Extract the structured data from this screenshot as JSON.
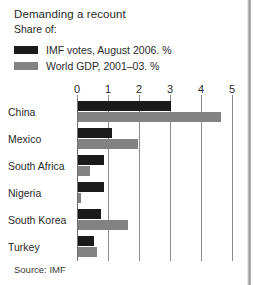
{
  "chart_data": {
    "type": "bar",
    "orientation": "horizontal",
    "title": "Demanding a recount",
    "subtitle": "Share of:",
    "source": "Source: IMF",
    "xlabel": "",
    "ylabel": "",
    "xlim": [
      0,
      5
    ],
    "xticks": [
      0,
      1,
      2,
      3,
      4,
      5
    ],
    "xtick_labels": [
      "0",
      "1",
      "2",
      "3",
      "4",
      "5"
    ],
    "grid": true,
    "legend_position": "top-left",
    "categories": [
      "China",
      "Mexico",
      "South Africa",
      "Nigeria",
      "South Korea",
      "Turkey"
    ],
    "series": [
      {
        "name": "IMF votes, August 2006. %",
        "color": "#1a1a1a",
        "values": [
          3.0,
          1.1,
          0.85,
          0.85,
          0.75,
          0.5
        ]
      },
      {
        "name": "World GDP, 2001–03. %",
        "color": "#828282",
        "values": [
          4.6,
          1.95,
          0.4,
          0.1,
          1.6,
          0.6
        ]
      }
    ]
  },
  "colors": {
    "series_1": "#1a1a1a",
    "series_2": "#828282",
    "gridline": "#8c8c8c",
    "text": "#2a2a2a",
    "background": "#ffffff"
  }
}
